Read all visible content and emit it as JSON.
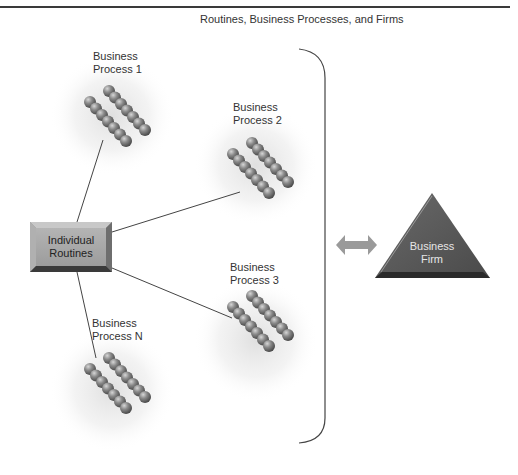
{
  "title": "Routines, Business Processes, and Firms",
  "routines_box": {
    "line1": "Individual",
    "line2": "Routines"
  },
  "processes": [
    {
      "id": "bp1",
      "line1": "Business",
      "line2": "Process 1"
    },
    {
      "id": "bp2",
      "line1": "Business",
      "line2": "Process 2"
    },
    {
      "id": "bp3",
      "line1": "Business",
      "line2": "Process 3"
    },
    {
      "id": "bpn",
      "line1": "Business",
      "line2": "Process N"
    }
  ],
  "firm": {
    "line1": "Business",
    "line2": "Firm"
  },
  "colors": {
    "ball": "#7a7a7a",
    "box": "#a9a9a9",
    "triangle": "#555555",
    "arrow": "#9a9a9a",
    "line": "#444444"
  }
}
